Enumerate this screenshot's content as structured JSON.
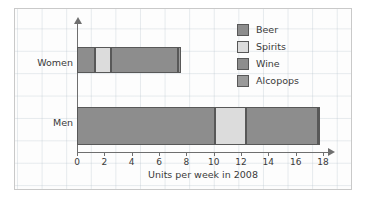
{
  "chart_data": {
    "type": "bar",
    "orientation": "horizontal",
    "stacked": true,
    "title": "",
    "xlabel": "Units per week in 2008",
    "ylabel": "",
    "xlim": [
      0,
      18
    ],
    "xticks": [
      0,
      2,
      4,
      6,
      8,
      10,
      12,
      14,
      16,
      18
    ],
    "grid": true,
    "legend_position": "top-right",
    "categories": [
      "Women",
      "Men"
    ],
    "series": [
      {
        "name": "Beer",
        "color": "#8d8d8d",
        "values": [
          1.3,
          10.1
        ]
      },
      {
        "name": "Spirits",
        "color": "#dcdcdc",
        "values": [
          1.2,
          2.3
        ]
      },
      {
        "name": "Wine",
        "color": "#8d8d8d",
        "values": [
          4.9,
          5.2
        ]
      },
      {
        "name": "Alcopops",
        "color": "#9a9a9a",
        "values": [
          0.2,
          0.2
        ]
      }
    ],
    "totals": [
      7.6,
      17.8
    ]
  },
  "axis": {
    "x_title": "Units per week in 2008",
    "tick_labels": [
      "0",
      "2",
      "4",
      "6",
      "8",
      "10",
      "12",
      "14",
      "16",
      "18"
    ]
  },
  "categories": {
    "women": "Women",
    "men": "Men"
  },
  "legend": {
    "items": [
      {
        "label": "Beer",
        "color": "#8d8d8d"
      },
      {
        "label": "Spirits",
        "color": "#dcdcdc"
      },
      {
        "label": "Wine",
        "color": "#8d8d8d"
      },
      {
        "label": "Alcopops",
        "color": "#9a9a9a"
      }
    ]
  }
}
